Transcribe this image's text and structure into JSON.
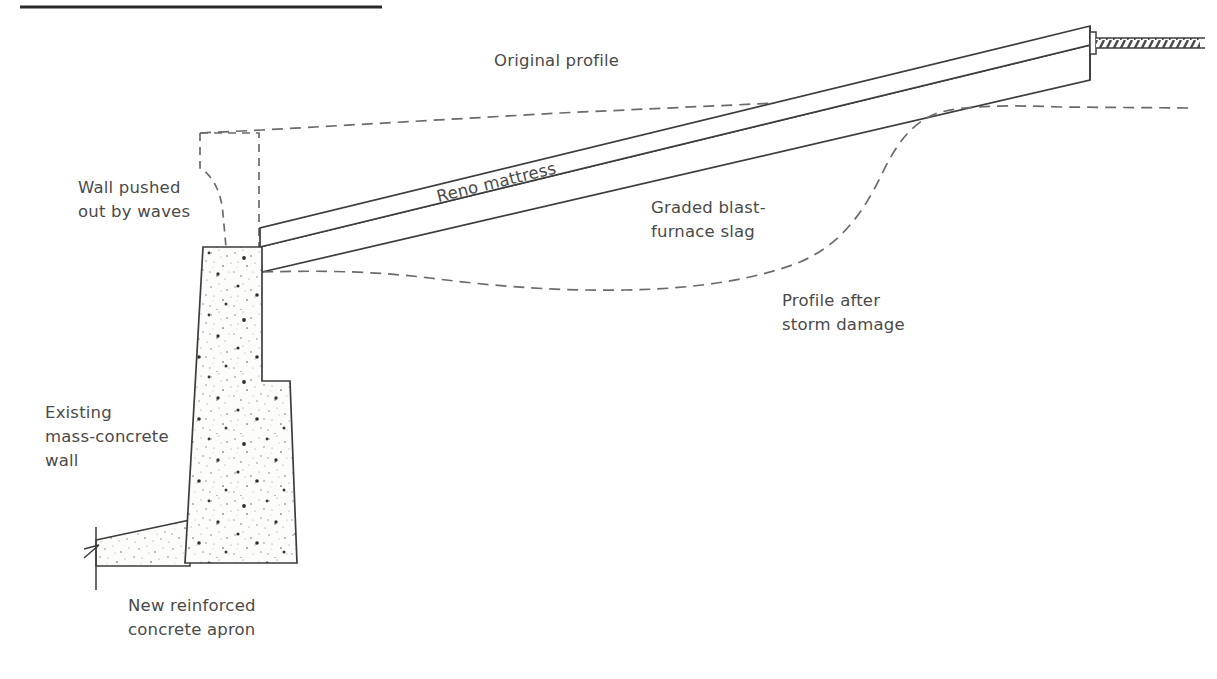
{
  "figure": {
    "domain": "diagram",
    "type": "engineering-cross-section",
    "background_color": "#ffffff",
    "line_color": "#3d3d3d",
    "dashed_color": "#6b6b6b",
    "text_color": "#4a4a4a",
    "fill_color": "#fbfbf8",
    "rule_color": "#2b2b2b"
  },
  "labels": {
    "original_profile": "Original profile",
    "wall_pushed_out": "Wall pushed\nout by waves",
    "reno_mattress": "Reno mattress",
    "graded_slag": "Graded blast-\nfurnace slag",
    "profile_after_storm": "Profile after\nstorm damage",
    "existing_wall": "Existing\nmass-concrete\nwall",
    "new_apron": "New reinforced\nconcrete apron"
  },
  "elements": {
    "top_rule": "top-horizontal-rule",
    "mass_concrete_wall": "mass-concrete-wall-body",
    "apron_slab": "reinforced-concrete-apron",
    "reno_mattress_layer": "reno-mattress-slope-layer",
    "slag_layer": "graded-blast-furnace-slag-layer",
    "original_wall_outline": "original-wall-dashed-outline",
    "original_profile_line": "original-beach-profile-dashed-line",
    "storm_profile_line": "post-storm-beach-profile-dashed-line",
    "crest_ground": "crest-ground-hatched-band",
    "break_line": "apron-break-line"
  },
  "geometry": {
    "top_rule": {
      "x1": 20,
      "y1": 7,
      "x2": 382,
      "y2": 7
    },
    "wall_top_y": 247,
    "wall_base_y": 563,
    "crest_x": 1090,
    "crest_mattress_y": 45,
    "crest_slag_y": 80,
    "mattress_thickness_px": 20,
    "slag_layer_thickness_px": 26
  }
}
